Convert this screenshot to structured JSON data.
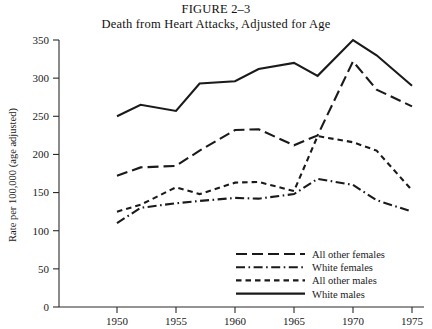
{
  "figure": {
    "number_label": "FIGURE 2–3",
    "title": "Death from Heart Attacks, Adjusted for Age"
  },
  "chart_data": {
    "type": "line",
    "title": "Death from Heart Attacks, Adjusted for Age",
    "xlabel": "",
    "ylabel": "Rate per 100,000 (age adjusted)",
    "xlim": [
      1948,
      1976
    ],
    "ylim": [
      0,
      350
    ],
    "ytick_values": [
      0,
      50,
      100,
      150,
      200,
      250,
      300,
      350
    ],
    "ytick_labels": [
      "0",
      "50",
      "100",
      "150",
      "200",
      "250",
      "300",
      "350"
    ],
    "xtick_values": [
      1950,
      1955,
      1960,
      1965,
      1970,
      1975
    ],
    "xtick_labels": [
      "1950",
      "1955",
      "1960",
      "1965",
      "1970",
      "1975"
    ],
    "grid": false,
    "legend_position": "lower right",
    "series": [
      {
        "name": "All other females",
        "style": "long-dash",
        "x": [
          1950,
          1952,
          1955,
          1957,
          1960,
          1962,
          1965,
          1967,
          1970,
          1972,
          1975
        ],
        "values": [
          172,
          183,
          185,
          205,
          232,
          233,
          212,
          225,
          322,
          285,
          263
        ]
      },
      {
        "name": "White females",
        "style": "dash-dot",
        "x": [
          1950,
          1952,
          1955,
          1957,
          1960,
          1962,
          1965,
          1967,
          1970,
          1972,
          1975
        ],
        "values": [
          110,
          130,
          136,
          139,
          143,
          142,
          148,
          168,
          160,
          140,
          125
        ]
      },
      {
        "name": "All other males",
        "style": "short-dash",
        "x": [
          1950,
          1952,
          1955,
          1957,
          1960,
          1962,
          1965,
          1967,
          1970,
          1972,
          1975
        ],
        "values": [
          125,
          134,
          157,
          148,
          163,
          164,
          152,
          224,
          216,
          205,
          153
        ]
      },
      {
        "name": "White males",
        "style": "solid",
        "x": [
          1950,
          1952,
          1955,
          1957,
          1960,
          1962,
          1965,
          1967,
          1970,
          1972,
          1975
        ],
        "values": [
          250,
          265,
          257,
          293,
          296,
          312,
          320,
          303,
          350,
          330,
          290
        ]
      }
    ]
  },
  "legend": {
    "items": [
      {
        "label": "All other females",
        "style": "long-dash"
      },
      {
        "label": "White females",
        "style": "dash-dot"
      },
      {
        "label": "All other males",
        "style": "short-dash"
      },
      {
        "label": "White males",
        "style": "solid"
      }
    ]
  },
  "colors": {
    "ink": "#1a1a1a",
    "axis": "#2b2b2b",
    "background": "#ffffff"
  }
}
